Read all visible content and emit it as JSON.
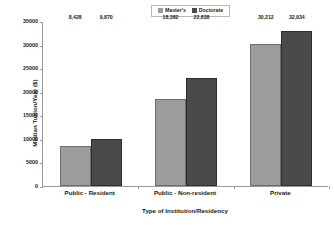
{
  "chart_data": {
    "type": "bar",
    "title": "",
    "xlabel": "Type of Institution/Residency",
    "ylabel": "Median Tuition/Year ($)",
    "categories": [
      "Public - Resident",
      "Public - Non-resident",
      "Private"
    ],
    "series": [
      {
        "name": "Master's",
        "color": "#9c9c9c",
        "values": [
          8428,
          18382,
          30212
        ],
        "labels": [
          "8,428",
          "18,382",
          "30,212"
        ]
      },
      {
        "name": "Doctorate",
        "color": "#4a4a4a",
        "values": [
          9870,
          22838,
          32934
        ],
        "labels": [
          "9,870",
          "22,838",
          "32,934"
        ]
      }
    ],
    "ylim": [
      0,
      35000
    ],
    "yticks": [
      0,
      5000,
      10000,
      15000,
      20000,
      25000,
      30000,
      35000
    ],
    "ytick_labels": [
      "0",
      "5000",
      "10000",
      "15000",
      "20000",
      "25000",
      "30000",
      "35000"
    ],
    "grid": false,
    "legend_position": "top-center"
  }
}
